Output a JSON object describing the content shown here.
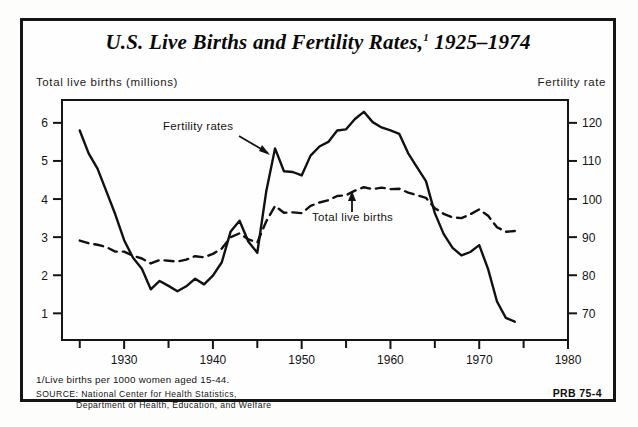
{
  "figure": {
    "title": "U.S. Live Births and Fertility Rates,",
    "title_superscript": "1",
    "title_years": " 1925–1974",
    "left_axis_header": "Total live births (millions)",
    "right_axis_header": "Fertility rate",
    "footnote": "1/Live births per 1000 women aged 15-44.",
    "source_label": "SOURCE:",
    "source_line1": " National Center for Health Statistics,",
    "source_line2": "Department of Health, Education, and Welfare",
    "credit": "PRB 75-4"
  },
  "chart_data": {
    "type": "line",
    "xlabel": "",
    "ylabel": "Total live births (millions)",
    "y2label": "Fertility rate",
    "xlim": [
      1923,
      1980
    ],
    "ylim": [
      0.3,
      6.6
    ],
    "y2lim": [
      63,
      126
    ],
    "grid": false,
    "legend_position": "inline-annotations",
    "x_ticks_major": [
      1930,
      1940,
      1950,
      1960,
      1970,
      1980
    ],
    "x_ticks_minor": [
      1925,
      1935,
      1945,
      1955,
      1965,
      1975
    ],
    "y_ticks_left": [
      1,
      2,
      3,
      4,
      5,
      6
    ],
    "y_ticks_right": [
      70,
      80,
      90,
      100,
      110,
      120
    ],
    "annotations": [
      {
        "text": "Fertility rates",
        "target_series": "Fertility rate",
        "arrow": "down-right"
      },
      {
        "text": "Total live births",
        "target_series": "Total live births",
        "arrow": "up"
      }
    ],
    "x": [
      1925,
      1926,
      1927,
      1928,
      1929,
      1930,
      1931,
      1932,
      1933,
      1934,
      1935,
      1936,
      1937,
      1938,
      1939,
      1940,
      1941,
      1942,
      1943,
      1944,
      1945,
      1946,
      1947,
      1948,
      1949,
      1950,
      1951,
      1952,
      1953,
      1954,
      1955,
      1956,
      1957,
      1958,
      1959,
      1960,
      1961,
      1962,
      1963,
      1964,
      1965,
      1966,
      1967,
      1968,
      1969,
      1970,
      1971,
      1972,
      1973,
      1974
    ],
    "series": [
      {
        "name": "Fertility rate",
        "style": "solid",
        "axis": "right",
        "units": "live births per 1000 women aged 15-44",
        "values": [
          118.0,
          112.0,
          108.0,
          102.0,
          96.0,
          89.2,
          84.6,
          81.7,
          76.3,
          78.5,
          77.2,
          75.8,
          77.1,
          79.1,
          77.6,
          79.9,
          83.4,
          91.5,
          94.3,
          88.8,
          85.9,
          101.9,
          113.3,
          107.3,
          107.1,
          106.2,
          111.4,
          113.8,
          115.0,
          118.0,
          118.3,
          121.0,
          122.9,
          120.2,
          118.8,
          118.0,
          117.1,
          112.0,
          108.3,
          104.7,
          96.3,
          90.8,
          87.2,
          85.2,
          86.1,
          87.9,
          81.6,
          73.1,
          68.8,
          67.8
        ]
      },
      {
        "name": "Total live births",
        "style": "dashed",
        "axis": "left",
        "units": "millions",
        "values": [
          2.91,
          2.84,
          2.8,
          2.74,
          2.62,
          2.62,
          2.51,
          2.44,
          2.31,
          2.4,
          2.38,
          2.36,
          2.41,
          2.5,
          2.47,
          2.56,
          2.7,
          3.0,
          3.1,
          2.94,
          2.86,
          3.41,
          3.82,
          3.64,
          3.65,
          3.63,
          3.82,
          3.91,
          3.97,
          4.08,
          4.1,
          4.22,
          4.31,
          4.26,
          4.3,
          4.26,
          4.27,
          4.17,
          4.1,
          4.03,
          3.76,
          3.61,
          3.52,
          3.5,
          3.6,
          3.73,
          3.56,
          3.26,
          3.14,
          3.16
        ]
      }
    ]
  }
}
